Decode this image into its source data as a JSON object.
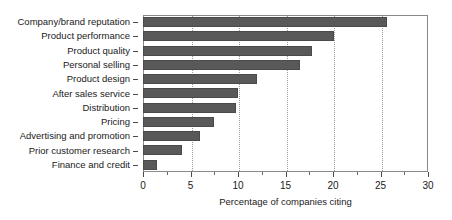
{
  "chart_data": {
    "type": "bar",
    "orientation": "horizontal",
    "title": "",
    "xlabel": "Percentage of companies citing",
    "ylabel": "",
    "xlim": [
      0,
      30
    ],
    "xticks": [
      0,
      5,
      10,
      15,
      20,
      25,
      30
    ],
    "xtick_labels": [
      "0",
      "5",
      "10",
      "15",
      "20",
      "25",
      "30"
    ],
    "grid": true,
    "grid_axis": "x",
    "legend": false,
    "bar_color": "#595959",
    "bar_edge_color": "#4a4a4a",
    "frame_color": "#8a8a8a",
    "categories": [
      "Company/brand reputation",
      "Product performance",
      "Product quality",
      "Personal selling",
      "Product design",
      "After sales service",
      "Distribution",
      "Pricing",
      "Advertising and promotion",
      "Prior customer research",
      "Finance and credit"
    ],
    "values": [
      25.7,
      20.1,
      17.8,
      16.5,
      12.0,
      10.0,
      9.8,
      7.5,
      6.0,
      4.1,
      1.5
    ]
  }
}
